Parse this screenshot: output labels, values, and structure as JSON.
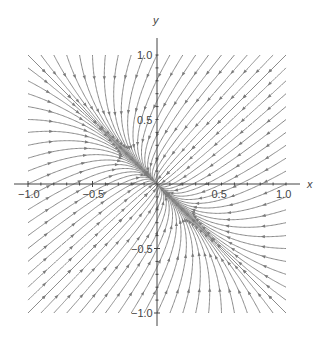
{
  "chart_data": {
    "type": "streamplot",
    "title": "",
    "xlabel": "x",
    "ylabel": "y",
    "xlim": [
      -1.0,
      1.0
    ],
    "ylim": [
      -1.0,
      1.0
    ],
    "x_ticks": [
      {
        "value": -1.0,
        "label": "-1.0"
      },
      {
        "value": -0.5,
        "label": "-0.5"
      },
      {
        "value": 0.5,
        "label": "0.5"
      },
      {
        "value": 1.0,
        "label": "1.0"
      }
    ],
    "y_ticks": [
      {
        "value": 1.0,
        "label": "1.0"
      },
      {
        "value": 0.5,
        "label": "0.5"
      },
      {
        "value": -0.5,
        "label": "-0.5"
      },
      {
        "value": -1.0,
        "label": "-1.0"
      }
    ],
    "grid": false,
    "legend": null,
    "field": {
      "fast_direction": [
        1,
        1
      ],
      "fast_rate": 1.0,
      "slow_direction": [
        1,
        -1
      ],
      "slow_rate": 0.35
    },
    "colors": {
      "stream": "#8a8a8a",
      "arrow": "#7a7a7a",
      "axis": "#444444"
    }
  }
}
